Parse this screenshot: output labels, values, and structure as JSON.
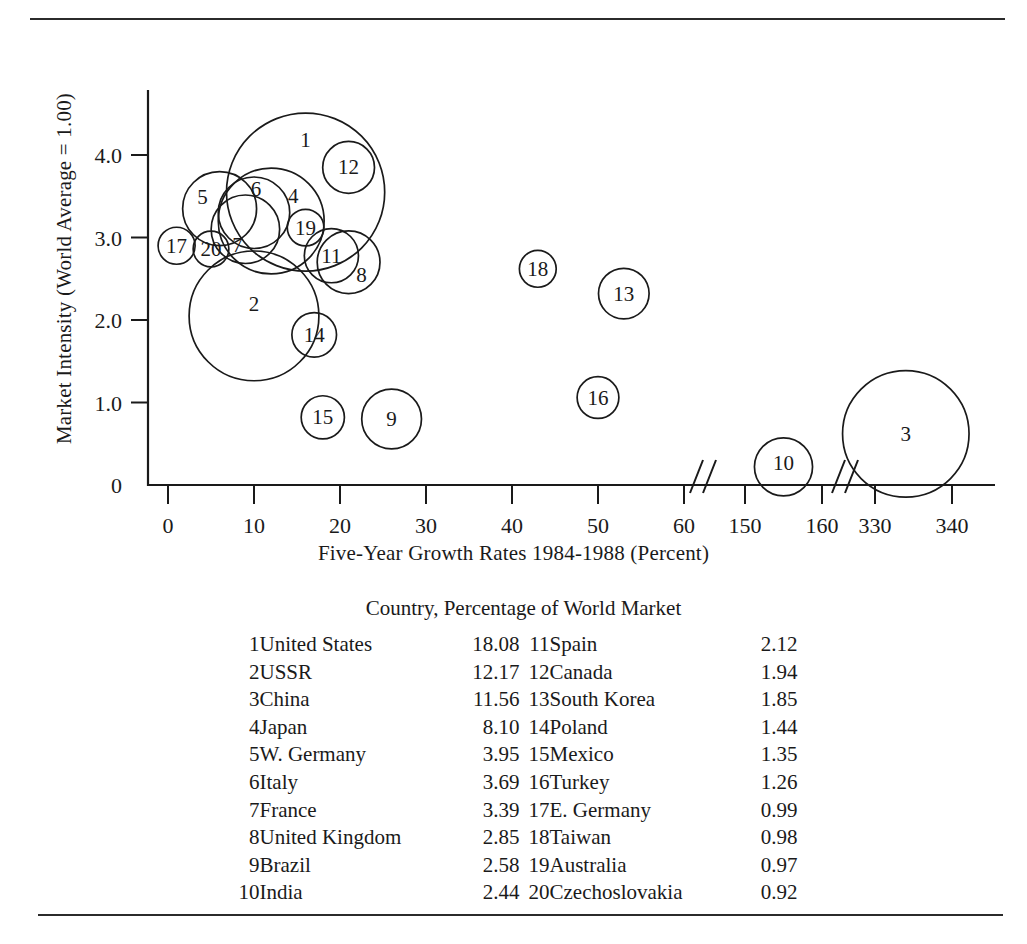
{
  "figure": {
    "rule_top": "horizontal-rule",
    "rule_bottom": "horizontal-rule"
  },
  "chart_data": {
    "type": "scatter",
    "title": "",
    "xlabel": "Five-Year Growth Rates 1984-1988 (Percent)",
    "ylabel": "Market Intensity (World Average = 1.00)",
    "xticks": [
      "0",
      "10",
      "20",
      "30",
      "40",
      "50",
      "60",
      "150",
      "160",
      "330",
      "340"
    ],
    "yticks": [
      "0",
      "1.0",
      "2.0",
      "3.0",
      "4.0"
    ],
    "xlim": [
      0,
      340
    ],
    "ylim": [
      0,
      4.4
    ],
    "grid": false,
    "legend_position": "below-plot",
    "axis_breaks": [
      "between 60 and 150",
      "between 160 and 330"
    ],
    "size_encoding": "Percentage of World Market",
    "points": [
      {
        "id": "1",
        "country": "United States",
        "x": 16,
        "y": 3.55,
        "size": 18.08,
        "label_dx": 0,
        "label_dy": -52
      },
      {
        "id": "2",
        "country": "USSR",
        "x": 10,
        "y": 2.05,
        "size": 12.17,
        "label_dx": 0,
        "label_dy": -12
      },
      {
        "id": "3",
        "country": "China",
        "x": 334,
        "y": 0.62,
        "size": 11.56,
        "label_dx": 0,
        "label_dy": 0
      },
      {
        "id": "4",
        "country": "Japan",
        "x": 12,
        "y": 3.2,
        "size": 8.1,
        "label_dx": 22,
        "label_dy": -25
      },
      {
        "id": "5",
        "country": "W. Germany",
        "x": 6,
        "y": 3.35,
        "size": 3.95,
        "label_dx": -17,
        "label_dy": -12
      },
      {
        "id": "6",
        "country": "Italy",
        "x": 10,
        "y": 3.3,
        "size": 3.69,
        "label_dx": 2,
        "label_dy": -24
      },
      {
        "id": "7",
        "country": "France",
        "x": 9,
        "y": 3.1,
        "size": 3.39,
        "label_dx": -8,
        "label_dy": 16
      },
      {
        "id": "8",
        "country": "United Kingdom",
        "x": 21,
        "y": 2.7,
        "size": 2.85,
        "label_dx": 13,
        "label_dy": 13
      },
      {
        "id": "9",
        "country": "Brazil",
        "x": 26,
        "y": 0.8,
        "size": 2.58,
        "label_dx": 0,
        "label_dy": 0
      },
      {
        "id": "10",
        "country": "India",
        "x": 155,
        "y": 0.22,
        "size": 2.44,
        "label_dx": 0,
        "label_dy": -4
      },
      {
        "id": "11",
        "country": "Spain",
        "x": 19,
        "y": 2.78,
        "size": 2.12,
        "label_dx": 0,
        "label_dy": 0
      },
      {
        "id": "12",
        "country": "Canada",
        "x": 21,
        "y": 3.85,
        "size": 1.94,
        "label_dx": 0,
        "label_dy": 0
      },
      {
        "id": "13",
        "country": "South Korea",
        "x": 53,
        "y": 2.32,
        "size": 1.85,
        "label_dx": 0,
        "label_dy": 0
      },
      {
        "id": "14",
        "country": "Poland",
        "x": 17,
        "y": 1.82,
        "size": 1.44,
        "label_dx": 0,
        "label_dy": 0
      },
      {
        "id": "15",
        "country": "Mexico",
        "x": 18,
        "y": 0.82,
        "size": 1.35,
        "label_dx": 0,
        "label_dy": 0
      },
      {
        "id": "16",
        "country": "Turkey",
        "x": 50,
        "y": 1.06,
        "size": 1.26,
        "label_dx": 0,
        "label_dy": 0
      },
      {
        "id": "17",
        "country": "E. Germany",
        "x": 1,
        "y": 2.9,
        "size": 0.99,
        "label_dx": 0,
        "label_dy": 0
      },
      {
        "id": "18",
        "country": "Taiwan",
        "x": 43,
        "y": 2.62,
        "size": 0.98,
        "label_dx": 0,
        "label_dy": 0
      },
      {
        "id": "19",
        "country": "Australia",
        "x": 16,
        "y": 3.12,
        "size": 0.97,
        "label_dx": 0,
        "label_dy": 0
      },
      {
        "id": "20",
        "country": "Czechoslovakia",
        "x": 5,
        "y": 2.86,
        "size": 0.92,
        "label_dx": 0,
        "label_dy": 0
      }
    ]
  },
  "legend": {
    "title": "Country, Percentage of World Market",
    "left_column": [
      {
        "idx": "1",
        "name": "United States",
        "value": "18.08"
      },
      {
        "idx": "2",
        "name": "USSR",
        "value": "12.17"
      },
      {
        "idx": "3",
        "name": "China",
        "value": "11.56"
      },
      {
        "idx": "4",
        "name": "Japan",
        "value": "8.10"
      },
      {
        "idx": "5",
        "name": "W. Germany",
        "value": "3.95"
      },
      {
        "idx": "6",
        "name": "Italy",
        "value": "3.69"
      },
      {
        "idx": "7",
        "name": "France",
        "value": "3.39"
      },
      {
        "idx": "8",
        "name": "United Kingdom",
        "value": "2.85"
      },
      {
        "idx": "9",
        "name": "Brazil",
        "value": "2.58"
      },
      {
        "idx": "10",
        "name": "India",
        "value": "2.44"
      }
    ],
    "right_column": [
      {
        "idx": "11",
        "name": "Spain",
        "value": "2.12"
      },
      {
        "idx": "12",
        "name": "Canada",
        "value": "1.94"
      },
      {
        "idx": "13",
        "name": "South Korea",
        "value": "1.85"
      },
      {
        "idx": "14",
        "name": "Poland",
        "value": "1.44"
      },
      {
        "idx": "15",
        "name": "Mexico",
        "value": "1.35"
      },
      {
        "idx": "16",
        "name": "Turkey",
        "value": "1.26"
      },
      {
        "idx": "17",
        "name": "E. Germany",
        "value": "0.99"
      },
      {
        "idx": "18",
        "name": "Taiwan",
        "value": "0.98"
      },
      {
        "idx": "19",
        "name": "Australia",
        "value": "0.97"
      },
      {
        "idx": "20",
        "name": "Czechoslovakia",
        "value": "0.92"
      }
    ]
  }
}
